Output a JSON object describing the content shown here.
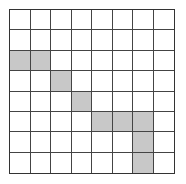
{
  "grid": {
    "rows": 8,
    "cols": 8,
    "shaded_color": "#c8c8c8",
    "line_color": "#444444",
    "shaded_cells": [
      [
        2,
        0
      ],
      [
        2,
        1
      ],
      [
        3,
        2
      ],
      [
        4,
        3
      ],
      [
        5,
        4
      ],
      [
        5,
        5
      ],
      [
        5,
        6
      ],
      [
        6,
        6
      ],
      [
        7,
        6
      ]
    ]
  }
}
